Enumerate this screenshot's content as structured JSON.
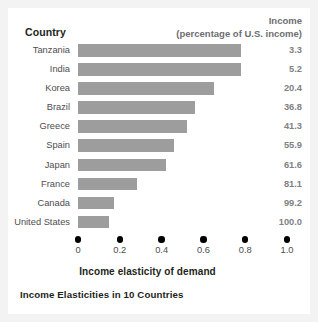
{
  "header": {
    "country_label": "Country",
    "income_line1": "Income",
    "income_line2": "(percentage of U.S. income)"
  },
  "axis": {
    "title": "Income elasticity of demand",
    "ticks": [
      "0",
      "0.2",
      "0.4",
      "0.6",
      "0.8",
      "1.0"
    ]
  },
  "caption": "Income Elasticities in 10 Countries",
  "colors": {
    "bar": "#9d9d9d",
    "text_dark": "#231f20",
    "text_muted": "#4d4d4f",
    "value_text": "#808285",
    "card_background": "#ffffff",
    "page_background": "#f3f3f3"
  },
  "chart_data": {
    "type": "bar",
    "title": "Income Elasticities in 10 Countries",
    "xlabel": "Income elasticity of demand",
    "ylabel": "Country",
    "orientation": "horizontal",
    "xlim": [
      0,
      1.0
    ],
    "xticks": [
      0,
      0.2,
      0.4,
      0.6,
      0.8,
      1.0
    ],
    "grid": false,
    "legend": "none",
    "categories": [
      "Tanzania",
      "India",
      "Korea",
      "Brazil",
      "Greece",
      "Spain",
      "Japan",
      "France",
      "Canada",
      "United States"
    ],
    "values": [
      0.78,
      0.78,
      0.65,
      0.56,
      0.52,
      0.46,
      0.42,
      0.28,
      0.17,
      0.15
    ],
    "series": [
      {
        "name": "Income elasticity of demand",
        "values": [
          0.78,
          0.78,
          0.65,
          0.56,
          0.52,
          0.46,
          0.42,
          0.28,
          0.17,
          0.15
        ]
      }
    ],
    "secondary_column": {
      "name": "Income (percentage of U.S. income)",
      "values": [
        "3.3",
        "5.2",
        "20.4",
        "36.8",
        "41.3",
        "55.9",
        "61.6",
        "81.1",
        "99.2",
        "100.0"
      ]
    },
    "rows": [
      {
        "country": "Tanzania",
        "elasticity": 0.78,
        "income": "3.3"
      },
      {
        "country": "India",
        "elasticity": 0.78,
        "income": "5.2"
      },
      {
        "country": "Korea",
        "elasticity": 0.65,
        "income": "20.4"
      },
      {
        "country": "Brazil",
        "elasticity": 0.56,
        "income": "36.8"
      },
      {
        "country": "Greece",
        "elasticity": 0.52,
        "income": "41.3"
      },
      {
        "country": "Spain",
        "elasticity": 0.46,
        "income": "55.9"
      },
      {
        "country": "Japan",
        "elasticity": 0.42,
        "income": "61.6"
      },
      {
        "country": "France",
        "elasticity": 0.28,
        "income": "81.1"
      },
      {
        "country": "Canada",
        "elasticity": 0.17,
        "income": "99.2"
      },
      {
        "country": "United States",
        "elasticity": 0.15,
        "income": "100.0"
      }
    ]
  }
}
